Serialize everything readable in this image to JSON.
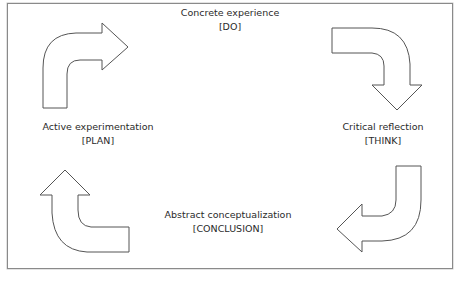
{
  "diagram": {
    "type": "cycle",
    "stages": [
      {
        "id": "do",
        "title": "Concrete experience",
        "tag": "[DO]",
        "position": "top"
      },
      {
        "id": "think",
        "title": "Critical reflection",
        "tag": "[THINK]",
        "position": "right"
      },
      {
        "id": "conclusion",
        "title": "Abstract conceptualization",
        "tag": "[CONCLUSION]",
        "position": "bottom"
      },
      {
        "id": "plan",
        "title": "Active experimentation",
        "tag": "[PLAN]",
        "position": "left"
      }
    ],
    "arrows": [
      {
        "id": "plan-to-do",
        "direction": "up-then-right",
        "corner": "top-left"
      },
      {
        "id": "do-to-think",
        "direction": "right-then-down",
        "corner": "top-right"
      },
      {
        "id": "think-to-conclusion",
        "direction": "down-then-left",
        "corner": "bottom-right"
      },
      {
        "id": "conclusion-to-plan",
        "direction": "left-then-up",
        "corner": "bottom-left"
      }
    ],
    "colors": {
      "stroke": "#555555",
      "fill": "#ffffff",
      "frame": "#8a8a8a",
      "text": "#2a2a2a"
    }
  }
}
